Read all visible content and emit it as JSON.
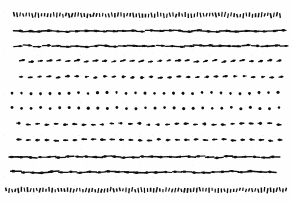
{
  "figure": {
    "title": "",
    "caption": "",
    "background_color": "#fefefe",
    "arrow_color": "#111111",
    "width": 293,
    "height": 202
  },
  "chart_data": {
    "type": "scatter",
    "plot_kind": "quiver",
    "title": "",
    "subtitle": "",
    "xlabel": "",
    "ylabel": "",
    "xlim": [
      0,
      293
    ],
    "ylim": [
      0,
      202
    ],
    "grid": false,
    "legend": null,
    "annotations": [],
    "rows": [
      {
        "index": 1,
        "y": 15,
        "x_start": 14,
        "x_end": 280,
        "count": 88,
        "direction": "vertical",
        "angle_deg": -90,
        "magnitude": 0.14,
        "style": "dense-ticks",
        "label": "row-1-dense-vertical-top"
      },
      {
        "index": 2,
        "y": 31,
        "x_start": 18,
        "x_end": 281,
        "count": 29,
        "direction": "right",
        "angle_deg": 0,
        "magnitude": 0.86,
        "style": "arrow",
        "label": "row-2-right-large"
      },
      {
        "index": 3,
        "y": 46,
        "x_start": 18,
        "x_end": 284,
        "count": 29,
        "direction": "right",
        "angle_deg": 0,
        "magnitude": 0.8,
        "style": "arrow",
        "label": "row-3-right-large"
      },
      {
        "index": 4,
        "y": 61,
        "x_start": 22,
        "x_end": 279,
        "count": 29,
        "direction": "right",
        "angle_deg": -12,
        "magnitude": 0.38,
        "style": "arrow",
        "label": "row-4-right-medium"
      },
      {
        "index": 5,
        "y": 77,
        "x_start": 21,
        "x_end": 281,
        "count": 29,
        "direction": "right",
        "angle_deg": -6,
        "magnitude": 0.3,
        "style": "arrow",
        "label": "row-5-right-medium"
      },
      {
        "index": 6,
        "y": 93,
        "x_start": 12,
        "x_end": 278,
        "count": 29,
        "direction": "down",
        "angle_deg": 82,
        "magnitude": 0.15,
        "style": "arrow",
        "label": "row-6-near-zero"
      },
      {
        "index": 7,
        "y": 108,
        "x_start": 12,
        "x_end": 279,
        "count": 29,
        "direction": "down",
        "angle_deg": 92,
        "magnitude": 0.12,
        "style": "arrow",
        "label": "row-7-near-zero"
      },
      {
        "index": 8,
        "y": 124,
        "x_start": 19,
        "x_end": 279,
        "count": 29,
        "direction": "left",
        "angle_deg": 180,
        "magnitude": 0.3,
        "style": "arrow",
        "label": "row-8-left-medium"
      },
      {
        "index": 9,
        "y": 140,
        "x_start": 19,
        "x_end": 280,
        "count": 29,
        "direction": "left",
        "angle_deg": 180,
        "magnitude": 0.34,
        "style": "arrow",
        "label": "row-9-left-medium"
      },
      {
        "index": 10,
        "y": 157,
        "x_start": 14,
        "x_end": 275,
        "count": 29,
        "direction": "left",
        "angle_deg": 180,
        "magnitude": 0.74,
        "style": "arrow",
        "label": "row-10-left-large"
      },
      {
        "index": 11,
        "y": 172,
        "x_start": 16,
        "x_end": 272,
        "count": 28,
        "direction": "left",
        "angle_deg": 180,
        "magnitude": 0.8,
        "style": "arrow",
        "label": "row-11-left-large"
      },
      {
        "index": 12,
        "y": 190,
        "x_start": 6,
        "x_end": 286,
        "count": 92,
        "direction": "vertical",
        "angle_deg": -90,
        "magnitude": 0.16,
        "style": "dense-ticks",
        "label": "row-12-dense-vertical-bottom"
      }
    ]
  }
}
